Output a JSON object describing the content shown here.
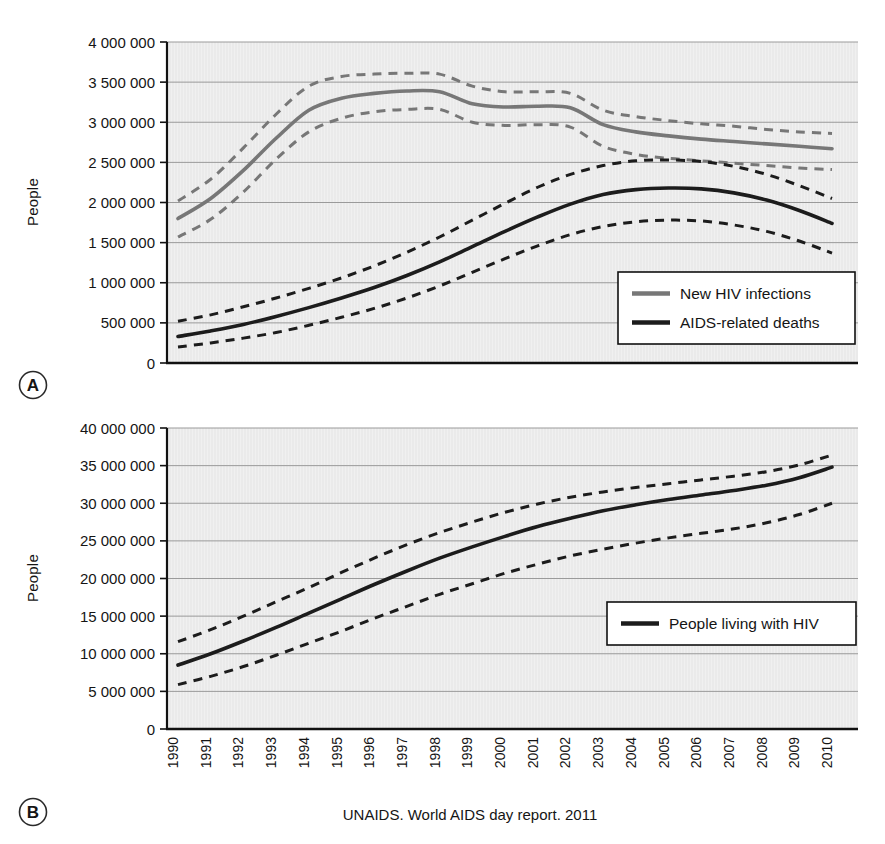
{
  "figure": {
    "caption": "UNAIDS. World AIDS day report. 2011",
    "panels": [
      {
        "letter": "A"
      },
      {
        "letter": "B"
      }
    ]
  },
  "colors": {
    "plot_background": "#f0f0f0",
    "gridline": "#9a9a9a",
    "axis": "#111111",
    "series_black": "#1c1c1c",
    "series_gray": "#777777",
    "legend_border": "#111111",
    "legend_fill": "#ffffff"
  },
  "chart_data": [
    {
      "type": "line",
      "panel": "A",
      "title": "",
      "xlabel": "",
      "ylabel": "People",
      "ylim": [
        0,
        4000000
      ],
      "xlim": [
        1990,
        2010
      ],
      "grid": true,
      "legend_position": "bottom-right",
      "ytick_labels": [
        "4 000 000",
        "3 500 000",
        "3 000 000",
        "2 500 000",
        "2 000 000",
        "1 500 000",
        "1 000 000",
        "500 000",
        "0"
      ],
      "ytick_values": [
        4000000,
        3500000,
        3000000,
        2500000,
        2000000,
        1500000,
        1000000,
        500000,
        0
      ],
      "x": [
        1990,
        1991,
        1992,
        1993,
        1994,
        1995,
        1996,
        1997,
        1998,
        1999,
        2000,
        2001,
        2002,
        2003,
        2004,
        2005,
        2006,
        2007,
        2008,
        2009,
        2010
      ],
      "categories": [
        "1990",
        "1991",
        "1992",
        "1993",
        "1994",
        "1995",
        "1996",
        "1997",
        "1998",
        "1999",
        "2000",
        "2001",
        "2002",
        "2003",
        "2004",
        "2005",
        "2006",
        "2007",
        "2008",
        "2009",
        "2010"
      ],
      "series": [
        {
          "name": "New HIV infections",
          "color": "#777777",
          "style": "solid",
          "values": [
            1800000,
            2050000,
            2400000,
            2800000,
            3150000,
            3300000,
            3360000,
            3390000,
            3380000,
            3230000,
            3190000,
            3200000,
            3180000,
            2970000,
            2880000,
            2830000,
            2790000,
            2760000,
            2730000,
            2700000,
            2670000
          ]
        },
        {
          "name": "New HIV infections upper bound",
          "color": "#777777",
          "style": "dashed",
          "values": [
            2020000,
            2290000,
            2680000,
            3100000,
            3450000,
            3570000,
            3600000,
            3610000,
            3600000,
            3450000,
            3380000,
            3380000,
            3360000,
            3150000,
            3070000,
            3020000,
            2980000,
            2950000,
            2910000,
            2880000,
            2860000
          ]
        },
        {
          "name": "New HIV infections lower bound",
          "color": "#777777",
          "style": "dashed",
          "values": [
            1570000,
            1790000,
            2130000,
            2540000,
            2880000,
            3050000,
            3130000,
            3160000,
            3160000,
            3000000,
            2960000,
            2970000,
            2940000,
            2700000,
            2600000,
            2550000,
            2520000,
            2490000,
            2460000,
            2430000,
            2410000
          ]
        },
        {
          "name": "AIDS-related deaths",
          "color": "#1c1c1c",
          "style": "solid",
          "values": [
            330000,
            400000,
            480000,
            580000,
            690000,
            810000,
            940000,
            1090000,
            1260000,
            1450000,
            1640000,
            1820000,
            1980000,
            2100000,
            2160000,
            2180000,
            2170000,
            2120000,
            2030000,
            1900000,
            1740000
          ]
        },
        {
          "name": "AIDS-related deaths upper bound",
          "color": "#1c1c1c",
          "style": "dashed",
          "values": [
            520000,
            600000,
            700000,
            810000,
            930000,
            1060000,
            1210000,
            1380000,
            1570000,
            1780000,
            1990000,
            2190000,
            2350000,
            2460000,
            2520000,
            2530000,
            2510000,
            2450000,
            2350000,
            2210000,
            2050000
          ]
        },
        {
          "name": "AIDS-related deaths lower bound",
          "color": "#1c1c1c",
          "style": "dashed",
          "values": [
            200000,
            250000,
            310000,
            380000,
            470000,
            570000,
            680000,
            810000,
            960000,
            1130000,
            1300000,
            1460000,
            1600000,
            1700000,
            1760000,
            1780000,
            1770000,
            1720000,
            1640000,
            1520000,
            1370000
          ]
        }
      ],
      "legend": [
        {
          "label": "New HIV infections",
          "color": "#777777"
        },
        {
          "label": "AIDS-related deaths",
          "color": "#1c1c1c"
        }
      ]
    },
    {
      "type": "line",
      "panel": "B",
      "title": "",
      "xlabel": "",
      "ylabel": "People",
      "ylim": [
        0,
        40000000
      ],
      "xlim": [
        1990,
        2010
      ],
      "grid": true,
      "legend_position": "right",
      "ytick_labels": [
        "40 000 000",
        "35 000 000",
        "30 000 000",
        "25 000 000",
        "20 000 000",
        "15 000 000",
        "10 000 000",
        "5 000 000",
        "0"
      ],
      "ytick_values": [
        40000000,
        35000000,
        30000000,
        25000000,
        20000000,
        15000000,
        10000000,
        5000000,
        0
      ],
      "x": [
        1990,
        1991,
        1992,
        1993,
        1994,
        1995,
        1996,
        1997,
        1998,
        1999,
        2000,
        2001,
        2002,
        2003,
        2004,
        2005,
        2006,
        2007,
        2008,
        2009,
        2010
      ],
      "categories": [
        "1990",
        "1991",
        "1992",
        "1993",
        "1994",
        "1995",
        "1996",
        "1997",
        "1998",
        "1999",
        "2000",
        "2001",
        "2002",
        "2003",
        "2004",
        "2005",
        "2006",
        "2007",
        "2008",
        "2009",
        "2010"
      ],
      "series": [
        {
          "name": "People living with HIV",
          "color": "#1c1c1c",
          "style": "solid",
          "values": [
            8500000,
            10000000,
            11700000,
            13500000,
            15400000,
            17300000,
            19200000,
            21000000,
            22700000,
            24200000,
            25600000,
            26900000,
            28000000,
            29000000,
            29800000,
            30500000,
            31100000,
            31700000,
            32400000,
            33400000,
            34800000
          ]
        },
        {
          "name": "People living with HIV upper bound",
          "color": "#1c1c1c",
          "style": "dashed",
          "values": [
            11600000,
            13200000,
            15000000,
            16900000,
            18800000,
            20800000,
            22700000,
            24500000,
            26100000,
            27500000,
            28800000,
            29900000,
            30800000,
            31500000,
            32100000,
            32600000,
            33100000,
            33600000,
            34200000,
            35100000,
            36400000
          ]
        },
        {
          "name": "People living with HIV lower bound",
          "color": "#1c1c1c",
          "style": "dashed",
          "values": [
            5900000,
            7000000,
            8300000,
            9800000,
            11400000,
            13000000,
            14700000,
            16300000,
            17900000,
            19300000,
            20700000,
            21900000,
            23000000,
            23900000,
            24700000,
            25400000,
            26000000,
            26600000,
            27400000,
            28500000,
            30000000
          ]
        }
      ],
      "legend": [
        {
          "label": "People living with HIV",
          "color": "#1c1c1c"
        }
      ]
    }
  ]
}
